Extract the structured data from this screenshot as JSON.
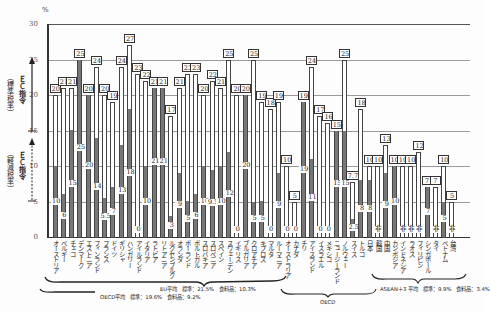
{
  "chart_data": {
    "type": "bar",
    "title": "",
    "xlabel": "",
    "ylabel": "%",
    "ylim": [
      0,
      30
    ],
    "yticks": [
      0,
      5,
      10,
      15,
      20,
      25,
      30
    ],
    "grid": true,
    "legend": "none",
    "categories": [
      "オーストリア",
      "ベルギー",
      "チェコ",
      "デンマーク",
      "エストニア",
      "フィンランド",
      "フランス",
      "ドイツ",
      "ギリシャ",
      "ハンガリー",
      "アイルランド",
      "イタリア",
      "ラトビア",
      "リトアニア",
      "ルクセンブルク",
      "オランダ",
      "ポーランド",
      "ポルトガル",
      "スロバキア",
      "スロベニア",
      "スペイン",
      "スウェーデン",
      "イギリス",
      "ブルガリア",
      "クロアチア",
      "キプロス",
      "マルタ",
      "ルーマニア",
      "オーストラリア",
      "カナダ",
      "チリ",
      "アイスランド",
      "イスラエル",
      "メキシコ",
      "ニュージーランド",
      "ノルウェー",
      "スイス",
      "トルコ",
      "日本",
      "韓国",
      "中国",
      "カンボジア",
      "インドネシア",
      "ラオス",
      "フィリピン",
      "シンガポール",
      "タイ",
      "ベトナム",
      "台湾"
    ],
    "series": [
      {
        "name": "標準税率",
        "values": [
          20,
          21,
          21,
          25,
          20,
          24,
          20,
          19,
          24,
          27,
          23,
          22,
          21,
          21,
          17,
          21,
          23,
          23,
          20,
          22,
          21,
          25,
          20,
          20,
          25,
          19,
          18,
          19,
          10,
          5,
          19,
          24,
          17,
          16,
          15,
          25,
          7.7,
          18,
          10,
          10,
          13,
          10,
          10,
          10,
          12,
          7,
          7,
          10,
          5
        ],
        "labels": [
          "20",
          "21",
          "21",
          "25",
          "20",
          "24",
          "20",
          "19",
          "24",
          "27",
          "23",
          "22",
          "21",
          "21",
          "17",
          "21",
          "23",
          "23",
          "20",
          "22",
          "21",
          "25",
          "20",
          "20",
          "25",
          "19",
          "18",
          "19",
          "10",
          "5",
          "19",
          "24",
          "17",
          "16",
          "15",
          "25",
          "7.7",
          "18",
          "10",
          "10",
          "13",
          "10",
          "10",
          "10",
          "12",
          "7",
          "7",
          "10",
          "5"
        ]
      },
      {
        "name": "軽減税率（食料品）",
        "values": [
          10,
          6,
          15,
          25,
          20,
          14,
          5.5,
          7,
          13,
          18,
          0,
          10,
          21,
          21,
          3,
          9,
          5,
          6,
          10,
          9.5,
          10,
          12,
          0,
          20,
          5,
          5,
          0,
          9,
          0,
          0,
          19,
          11,
          0,
          0,
          15,
          15,
          2.5,
          8,
          8,
          null,
          9,
          10,
          null,
          null,
          null,
          7,
          null,
          5,
          null
        ],
        "labels": [
          "10",
          "6",
          "15",
          "25",
          "20",
          "14",
          "5.5",
          "7",
          "13",
          "18",
          "0",
          "10",
          "21",
          "21",
          "3",
          "9",
          "5",
          "6",
          "10",
          "9.5",
          "10",
          "12",
          "0",
          "20",
          "5",
          "5",
          "0",
          "9",
          "0",
          "0",
          "19",
          "11",
          "0",
          "0",
          "15",
          "15",
          "2.5",
          "8",
          "8",
          "非",
          "9",
          "10",
          "非",
          "非",
          "非",
          "7",
          "非",
          "5",
          "非"
        ]
      }
    ],
    "groups": [
      {
        "name": "EU",
        "from": 0,
        "to": 27,
        "label": "EU平均　標準：21.5%　食料品：10.3%"
      },
      {
        "name": "OECD平均",
        "label": "OECD平均　標準：19.6%　食料品：9.2%"
      },
      {
        "name": "OECD",
        "from": 28,
        "to": 38,
        "label": "OECD"
      },
      {
        "name": "ASEAN＋3",
        "from": 38,
        "to": 48,
        "label": "ASEAN＋3 平均　標準：9.9%　食料品：3.4%"
      }
    ]
  },
  "axis": {
    "unit": "%",
    "upper_arrow": {
      "main": "ＥＣ指令",
      "sub": "（標準税率）",
      "from": 15,
      "to": 25
    },
    "lower_arrow": {
      "main": "ＥＣ指令",
      "sub": "（軽減税率）",
      "from": 5,
      "to": 14
    }
  },
  "colors": {
    "reduced_fill": "#777777",
    "standard_fill": "#ffffff",
    "outline": "#444444",
    "grid": "#9a9a9a"
  }
}
